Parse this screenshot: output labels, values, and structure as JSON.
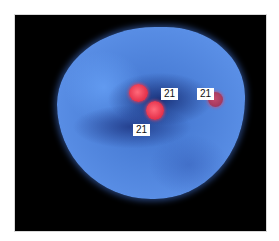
{
  "image": {
    "description": "Fluorescence in situ hybridization (FISH) micrograph: blue-stained nucleus with three red chromosome 21 signals",
    "colors": {
      "background": "#000000",
      "nucleus": "#4a7fd8",
      "signal": "#e8364f",
      "label_bg": "#ffffff"
    }
  },
  "labels": [
    {
      "text": "21"
    },
    {
      "text": "21"
    },
    {
      "text": "21"
    }
  ]
}
